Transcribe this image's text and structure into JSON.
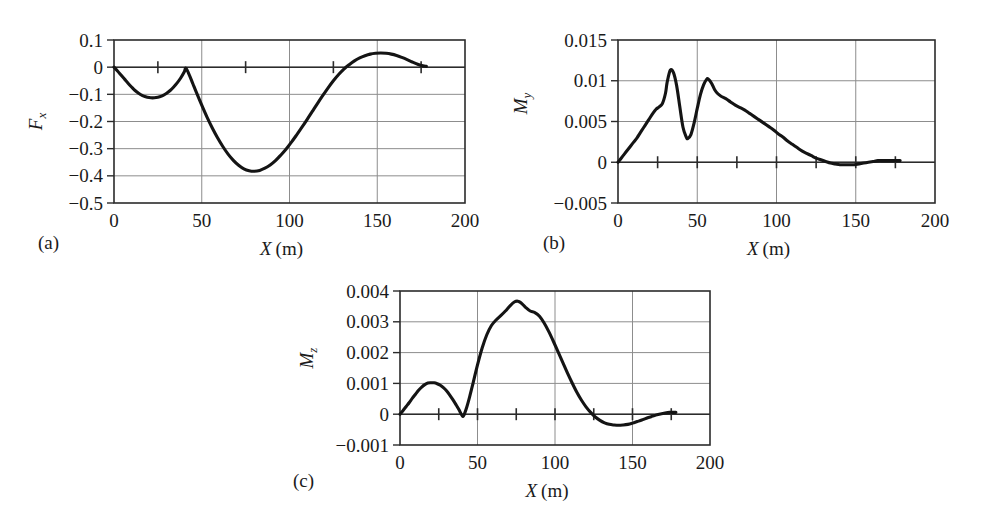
{
  "figure": {
    "background": "#ffffff",
    "curve_color": "#141414",
    "grid_color": "#8d8d8d",
    "axis_color": "#2b2b2b"
  },
  "panels": [
    {
      "caption": "(a)",
      "xlabel_symbol": "X",
      "xlabel_unit": "(m)"
    },
    {
      "caption": "(b)",
      "xlabel_symbol": "X",
      "xlabel_unit": "(m)"
    },
    {
      "caption": "(c)",
      "xlabel_symbol": "X",
      "xlabel_unit": "(m)"
    }
  ],
  "chart_data": [
    {
      "type": "line",
      "title": "",
      "panel": "(a)",
      "xlabel": "X (m)",
      "ylabel": "F_x",
      "ylabel_symbol": "F",
      "ylabel_subscript": "x",
      "xlim": [
        0,
        200
      ],
      "ylim": [
        -0.5,
        0.1
      ],
      "xticks": [
        0,
        50,
        100,
        150,
        200
      ],
      "xtick_labels": [
        "0",
        "50",
        "100",
        "150",
        "200"
      ],
      "yticks": [
        0.1,
        0,
        -0.1,
        -0.2,
        -0.3,
        -0.4,
        -0.5
      ],
      "ytick_labels": [
        "0.1",
        "0",
        "−0.1",
        "−0.2",
        "−0.3",
        "−0.4",
        "−0.5"
      ],
      "minor_xticks_on_zero": [
        25,
        75,
        125,
        175
      ],
      "grid": true,
      "legend": null,
      "x": [
        0,
        2,
        4,
        6,
        8,
        10,
        12,
        14,
        16,
        18,
        20,
        22,
        24,
        26,
        28,
        30,
        32,
        34,
        36,
        38,
        40,
        41,
        43,
        45,
        47,
        50,
        53,
        56,
        59,
        62,
        65,
        68,
        71,
        74,
        77,
        80,
        83,
        86,
        89,
        92,
        95,
        98,
        101,
        104,
        107,
        110,
        113,
        116,
        119,
        122,
        125,
        128,
        131,
        134,
        137,
        140,
        143,
        146,
        149,
        152,
        155,
        158,
        161,
        164,
        167,
        170,
        173,
        176,
        178
      ],
      "y": [
        0,
        -0.014,
        -0.029,
        -0.044,
        -0.059,
        -0.073,
        -0.086,
        -0.096,
        -0.104,
        -0.109,
        -0.112,
        -0.113,
        -0.112,
        -0.109,
        -0.104,
        -0.096,
        -0.086,
        -0.073,
        -0.058,
        -0.04,
        -0.018,
        -0.004,
        -0.03,
        -0.062,
        -0.094,
        -0.14,
        -0.184,
        -0.224,
        -0.26,
        -0.292,
        -0.32,
        -0.343,
        -0.361,
        -0.374,
        -0.381,
        -0.383,
        -0.38,
        -0.372,
        -0.36,
        -0.344,
        -0.324,
        -0.302,
        -0.277,
        -0.25,
        -0.222,
        -0.193,
        -0.163,
        -0.133,
        -0.104,
        -0.076,
        -0.05,
        -0.027,
        -0.007,
        0.009,
        0.023,
        0.034,
        0.042,
        0.048,
        0.051,
        0.052,
        0.051,
        0.048,
        0.043,
        0.036,
        0.028,
        0.019,
        0.011,
        0.005,
        0.003
      ]
    },
    {
      "type": "line",
      "title": "",
      "panel": "(b)",
      "xlabel": "X (m)",
      "ylabel": "M_y",
      "ylabel_symbol": "M",
      "ylabel_subscript": "y",
      "xlim": [
        0,
        200
      ],
      "ylim": [
        -0.005,
        0.015
      ],
      "xticks": [
        0,
        50,
        100,
        150,
        200
      ],
      "xtick_labels": [
        "0",
        "50",
        "100",
        "150",
        "200"
      ],
      "yticks": [
        0.015,
        0.01,
        0.005,
        0,
        -0.005
      ],
      "ytick_labels": [
        "0.015",
        "0.01",
        "0.005",
        "0",
        "−0.005"
      ],
      "minor_xticks_on_zero": [
        25,
        50,
        75,
        100,
        125,
        150,
        175
      ],
      "grid": true,
      "legend": null,
      "x": [
        0,
        2,
        4,
        6,
        8,
        10,
        12,
        14,
        16,
        18,
        20,
        22,
        24,
        26,
        28,
        30,
        31,
        33,
        35,
        37,
        39,
        41,
        43,
        44,
        46,
        48,
        50,
        52,
        54,
        56,
        57,
        59,
        61,
        63,
        65,
        68,
        71,
        74,
        77,
        80,
        83,
        86,
        89,
        92,
        95,
        98,
        101,
        104,
        107,
        110,
        113,
        116,
        119,
        122,
        125,
        128,
        131,
        134,
        137,
        140,
        143,
        146,
        149,
        152,
        155,
        158,
        161,
        164,
        167,
        170,
        173,
        176,
        178
      ],
      "y": [
        0,
        0.0005,
        0.001,
        0.0015,
        0.002,
        0.0025,
        0.003,
        0.0036,
        0.0042,
        0.0048,
        0.0054,
        0.006,
        0.0065,
        0.0068,
        0.0072,
        0.0085,
        0.0098,
        0.0113,
        0.011,
        0.0094,
        0.0068,
        0.0043,
        0.0031,
        0.0029,
        0.0034,
        0.0048,
        0.0066,
        0.0083,
        0.0095,
        0.0102,
        0.0102,
        0.0097,
        0.0089,
        0.0084,
        0.0081,
        0.0078,
        0.0074,
        0.007,
        0.0067,
        0.0064,
        0.006,
        0.0056,
        0.0052,
        0.0048,
        0.0044,
        0.004,
        0.0035,
        0.0031,
        0.0026,
        0.0022,
        0.0018,
        0.0014,
        0.0011,
        0.0008,
        0.0005,
        0.0003,
        0.0001,
        -0.0001,
        -0.0002,
        -0.0003,
        -0.0003,
        -0.0003,
        -0.0003,
        -0.0002,
        -0.0001,
        0.0,
        0.0001,
        0.0002,
        0.0002,
        0.0002,
        0.0002,
        0.0002,
        0.0002
      ]
    },
    {
      "type": "line",
      "title": "",
      "panel": "(c)",
      "xlabel": "X (m)",
      "ylabel": "M_z",
      "ylabel_symbol": "M",
      "ylabel_subscript": "z",
      "xlim": [
        0,
        200
      ],
      "ylim": [
        -0.001,
        0.004
      ],
      "xticks": [
        0,
        50,
        100,
        150,
        200
      ],
      "xtick_labels": [
        "0",
        "50",
        "100",
        "150",
        "200"
      ],
      "yticks": [
        0.004,
        0.003,
        0.002,
        0.001,
        0,
        -0.001
      ],
      "ytick_labels": [
        "0.004",
        "0.003",
        "0.002",
        "0.001",
        "0",
        "−0.001"
      ],
      "minor_xticks_on_zero": [
        25,
        50,
        75,
        100,
        125,
        150,
        175
      ],
      "grid": true,
      "legend": null,
      "x": [
        0,
        2,
        4,
        6,
        8,
        10,
        12,
        14,
        16,
        18,
        20,
        22,
        24,
        26,
        28,
        30,
        32,
        34,
        36,
        38,
        40,
        41,
        43,
        45,
        47,
        50,
        53,
        56,
        59,
        62,
        65,
        68,
        71,
        74,
        76,
        78,
        81,
        84,
        87,
        90,
        93,
        96,
        99,
        102,
        105,
        108,
        111,
        114,
        117,
        120,
        123,
        126,
        129,
        132,
        135,
        138,
        141,
        144,
        147,
        150,
        153,
        156,
        159,
        162,
        165,
        168,
        171,
        174,
        176,
        178
      ],
      "y": [
        0,
        0.00012,
        0.00025,
        0.00038,
        0.00052,
        0.00065,
        0.00078,
        0.00088,
        0.00096,
        0.00101,
        0.00102,
        0.00102,
        0.00099,
        0.00094,
        0.00086,
        0.00076,
        0.00063,
        0.00048,
        0.00032,
        0.00015,
        -4e-05,
        -5e-05,
        0.00022,
        0.00058,
        0.00098,
        0.0016,
        0.00215,
        0.00258,
        0.00288,
        0.00306,
        0.0032,
        0.00335,
        0.00352,
        0.00365,
        0.00367,
        0.00362,
        0.00347,
        0.00335,
        0.0033,
        0.00318,
        0.00296,
        0.00268,
        0.00236,
        0.00202,
        0.00168,
        0.00134,
        0.00102,
        0.00072,
        0.00046,
        0.00024,
        6e-05,
        -9e-05,
        -0.0002,
        -0.00028,
        -0.00033,
        -0.00035,
        -0.00036,
        -0.00035,
        -0.00033,
        -0.00029,
        -0.00024,
        -0.00019,
        -0.00013,
        -8e-05,
        -3e-05,
        1e-05,
        4e-05,
        6e-05,
        6e-05,
        6e-05
      ]
    }
  ]
}
